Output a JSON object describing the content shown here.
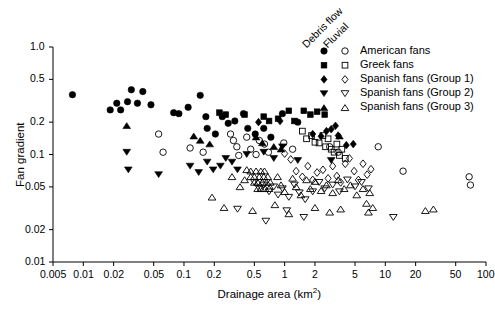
{
  "chart_data": {
    "type": "scatter",
    "title": "",
    "xlabel": "Drainage area (km2)",
    "xlabel_base": "Drainage area (km",
    "xlabel_sup": "2",
    "xlabel_tail": ")",
    "ylabel": "Fan gradient",
    "xscale": "log",
    "yscale": "log",
    "xlim": [
      0.005,
      100
    ],
    "ylim": [
      0.01,
      1.0
    ],
    "grid": false,
    "xticks": [
      0.005,
      0.01,
      0.02,
      0.05,
      0.1,
      0.2,
      0.5,
      1,
      2,
      5,
      10,
      20,
      50,
      100
    ],
    "xticklabels": [
      "0.005",
      "0.01",
      "0.02",
      "0.05",
      "0.1",
      "0.2",
      "0.5",
      "1",
      "2",
      "5",
      "10",
      "20",
      "50",
      "100"
    ],
    "yticks": [
      0.01,
      0.02,
      0.05,
      0.1,
      0.2,
      0.5,
      1.0
    ],
    "yticklabels": [
      "0.01",
      "0.02",
      "0.05",
      "0.1",
      "0.2",
      "0.5",
      "1.0"
    ],
    "legend": {
      "position": "top-right",
      "column_headers": [
        "Debris flow",
        "Fluvial"
      ],
      "header_rotation_deg": -45,
      "entries": [
        {
          "label": "American fans",
          "marker": "circle",
          "filled_marker": "filled-circle",
          "open_marker": "open-circle"
        },
        {
          "label": "Greek fans",
          "marker": "square",
          "filled_marker": "filled-square",
          "open_marker": "open-square"
        },
        {
          "label": "Spanish fans (Group 1)",
          "marker": "diamond",
          "filled_marker": "filled-diamond",
          "open_marker": "open-diamond"
        },
        {
          "label": "Spanish fans (Group 2)",
          "marker": "triangle-down",
          "filled_marker": "filled-tri-down",
          "open_marker": "open-tri-down"
        },
        {
          "label": "Spanish fans (Group 3)",
          "marker": "triangle-up",
          "filled_marker": "filled-tri-up",
          "open_marker": "open-tri-up"
        }
      ]
    },
    "series": [
      {
        "name": "American fans (debris flow)",
        "marker": "filled-circle",
        "points": [
          [
            0.0078,
            0.36
          ],
          [
            0.0185,
            0.26
          ],
          [
            0.0215,
            0.3
          ],
          [
            0.0235,
            0.26
          ],
          [
            0.0275,
            0.31
          ],
          [
            0.03,
            0.4
          ],
          [
            0.0345,
            0.3
          ],
          [
            0.039,
            0.385
          ],
          [
            0.047,
            0.29
          ],
          [
            0.079,
            0.245
          ],
          [
            0.089,
            0.24
          ],
          [
            0.11,
            0.275
          ],
          [
            0.145,
            0.355
          ],
          [
            0.165,
            0.225
          ],
          [
            0.17,
            0.175
          ],
          [
            0.205,
            0.155
          ],
          [
            0.24,
            0.225
          ],
          [
            0.275,
            0.195
          ],
          [
            0.32,
            0.205
          ],
          [
            0.39,
            0.24
          ],
          [
            0.43,
            0.175
          ],
          [
            0.51,
            0.155
          ],
          [
            0.62,
            0.175
          ],
          [
            0.73,
            0.145
          ],
          [
            0.95,
            0.24
          ],
          [
            1.35,
            0.2
          ]
        ]
      },
      {
        "name": "American fans (fluvial)",
        "marker": "open-circle",
        "points": [
          [
            0.056,
            0.155
          ],
          [
            0.062,
            0.105
          ],
          [
            0.115,
            0.115
          ],
          [
            0.155,
            0.105
          ],
          [
            0.29,
            0.155
          ],
          [
            0.31,
            0.135
          ],
          [
            0.335,
            0.118
          ],
          [
            0.35,
            0.098
          ],
          [
            0.42,
            0.145
          ],
          [
            0.46,
            0.112
          ],
          [
            0.52,
            0.1
          ],
          [
            0.56,
            0.135
          ],
          [
            0.63,
            0.125
          ],
          [
            0.69,
            0.105
          ],
          [
            0.98,
            0.128
          ],
          [
            1.2,
            0.112
          ],
          [
            2.8,
            0.118
          ],
          [
            3.4,
            0.105
          ],
          [
            8.5,
            0.118
          ],
          [
            15.0,
            0.07
          ],
          [
            68.0,
            0.062
          ],
          [
            70.0,
            0.052
          ]
        ]
      },
      {
        "name": "Greek fans (debris flow)",
        "marker": "filled-square",
        "points": [
          [
            0.225,
            0.245
          ],
          [
            0.26,
            0.235
          ],
          [
            0.4,
            0.235
          ],
          [
            0.62,
            0.225
          ],
          [
            0.7,
            0.205
          ],
          [
            0.86,
            0.215
          ],
          [
            1.1,
            0.255
          ],
          [
            1.25,
            0.205
          ],
          [
            1.55,
            0.255
          ],
          [
            1.8,
            0.235
          ],
          [
            2.1,
            0.25
          ],
          [
            2.5,
            0.235
          ]
        ]
      },
      {
        "name": "Greek fans (fluvial)",
        "marker": "open-square",
        "points": [
          [
            1.5,
            0.165
          ],
          [
            1.65,
            0.14
          ],
          [
            1.85,
            0.15
          ],
          [
            2.0,
            0.13
          ],
          [
            2.2,
            0.128
          ],
          [
            2.4,
            0.15
          ],
          [
            2.55,
            0.118
          ],
          [
            2.7,
            0.14
          ],
          [
            2.9,
            0.112
          ],
          [
            3.1,
            0.105
          ],
          [
            3.3,
            0.125
          ],
          [
            3.5,
            0.098
          ],
          [
            3.7,
            0.112
          ],
          [
            4.0,
            0.092
          ]
        ]
      },
      {
        "name": "Spanish fans Group 1 (debris flow)",
        "marker": "filled-diamond",
        "points": [
          [
            0.9,
            0.205
          ],
          [
            1.9,
            0.155
          ],
          [
            2.3,
            0.148
          ],
          [
            2.6,
            0.165
          ],
          [
            2.9,
            0.172
          ],
          [
            3.2,
            0.185
          ],
          [
            3.4,
            0.15
          ],
          [
            4.1,
            0.122
          ],
          [
            4.8,
            0.125
          ],
          [
            0.55,
            0.2
          ]
        ]
      },
      {
        "name": "Spanish fans Group 1 (fluvial)",
        "marker": "open-diamond",
        "points": [
          [
            1.15,
            0.09
          ],
          [
            1.3,
            0.07
          ],
          [
            1.5,
            0.062
          ],
          [
            1.7,
            0.078
          ],
          [
            1.9,
            0.058
          ],
          [
            2.1,
            0.068
          ],
          [
            2.4,
            0.072
          ],
          [
            2.7,
            0.06
          ],
          [
            3.0,
            0.078
          ],
          [
            3.3,
            0.063
          ],
          [
            3.6,
            0.055
          ],
          [
            4.0,
            0.082
          ],
          [
            4.4,
            0.092
          ],
          [
            4.9,
            0.07
          ],
          [
            5.4,
            0.058
          ],
          [
            6.0,
            0.082
          ],
          [
            6.6,
            0.065
          ],
          [
            7.2,
            0.073
          ],
          [
            1.0,
            0.102
          ]
        ]
      },
      {
        "name": "Spanish fans Group 2 (debris flow)",
        "marker": "filled-tri-down",
        "points": [
          [
            0.027,
            0.105
          ],
          [
            0.028,
            0.072
          ],
          [
            0.115,
            0.078
          ],
          [
            0.14,
            0.068
          ],
          [
            0.17,
            0.085
          ],
          [
            0.195,
            0.072
          ],
          [
            0.23,
            0.078
          ],
          [
            0.26,
            0.092
          ],
          [
            0.3,
            0.085
          ],
          [
            0.34,
            0.072
          ],
          [
            0.42,
            0.1
          ],
          [
            0.62,
            0.105
          ],
          [
            0.78,
            0.092
          ],
          [
            0.95,
            0.118
          ],
          [
            1.35,
            0.088
          ],
          [
            2.9,
            0.088
          ],
          [
            0.056,
            0.065
          ]
        ]
      },
      {
        "name": "Spanish fans Group 2 (fluvial)",
        "marker": "open-tri-down",
        "points": [
          [
            0.5,
            0.055
          ],
          [
            0.56,
            0.048
          ],
          [
            0.62,
            0.052
          ],
          [
            0.7,
            0.045
          ],
          [
            0.78,
            0.05
          ],
          [
            0.86,
            0.042
          ],
          [
            0.95,
            0.048
          ],
          [
            1.1,
            0.04
          ],
          [
            1.25,
            0.052
          ],
          [
            1.4,
            0.044
          ],
          [
            1.6,
            0.038
          ],
          [
            1.9,
            0.045
          ],
          [
            2.2,
            0.055
          ],
          [
            2.5,
            0.048
          ],
          [
            3.0,
            0.052
          ],
          [
            3.5,
            0.045
          ],
          [
            4.2,
            0.058
          ],
          [
            5.0,
            0.05
          ],
          [
            5.8,
            0.055
          ],
          [
            6.8,
            0.048
          ],
          [
            0.34,
            0.031
          ],
          [
            0.65,
            0.024
          ],
          [
            1.05,
            0.03
          ],
          [
            1.55,
            0.026
          ],
          [
            12.0,
            0.026
          ]
        ]
      },
      {
        "name": "Spanish fans Group 3 (debris flow)",
        "marker": "filled-tri-up",
        "points": [
          [
            0.027,
            0.185
          ],
          [
            0.125,
            0.148
          ],
          [
            0.145,
            0.135
          ],
          [
            0.18,
            0.125
          ],
          [
            0.52,
            0.145
          ],
          [
            0.6,
            0.128
          ],
          [
            0.78,
            0.118
          ],
          [
            3.5,
            0.148
          ],
          [
            0.92,
            0.112
          ]
        ]
      },
      {
        "name": "Spanish fans Group 3 (fluvial)",
        "marker": "open-tri-up",
        "points": [
          [
            0.42,
            0.072
          ],
          [
            0.46,
            0.062
          ],
          [
            0.5,
            0.055
          ],
          [
            0.54,
            0.048
          ],
          [
            0.46,
            0.07
          ],
          [
            0.5,
            0.062
          ],
          [
            0.54,
            0.055
          ],
          [
            0.58,
            0.048
          ],
          [
            0.52,
            0.07
          ],
          [
            0.56,
            0.062
          ],
          [
            0.6,
            0.055
          ],
          [
            0.64,
            0.048
          ],
          [
            0.58,
            0.07
          ],
          [
            0.62,
            0.062
          ],
          [
            0.66,
            0.055
          ],
          [
            0.63,
            0.07
          ],
          [
            0.68,
            0.062
          ],
          [
            0.72,
            0.055
          ],
          [
            0.7,
            0.048
          ],
          [
            0.4,
            0.058
          ],
          [
            0.36,
            0.05
          ],
          [
            0.3,
            0.062
          ],
          [
            0.85,
            0.062
          ],
          [
            0.92,
            0.052
          ],
          [
            1.0,
            0.045
          ],
          [
            1.2,
            0.06
          ],
          [
            1.3,
            0.05
          ],
          [
            1.45,
            0.042
          ],
          [
            1.65,
            0.058
          ],
          [
            1.8,
            0.048
          ],
          [
            2.0,
            0.056
          ],
          [
            2.3,
            0.046
          ],
          [
            2.6,
            0.052
          ],
          [
            3.0,
            0.044
          ],
          [
            3.4,
            0.058
          ],
          [
            3.9,
            0.048
          ],
          [
            4.5,
            0.052
          ],
          [
            5.2,
            0.042
          ],
          [
            6.0,
            0.048
          ],
          [
            7.0,
            0.044
          ],
          [
            0.25,
            0.032
          ],
          [
            0.48,
            0.03
          ],
          [
            0.8,
            0.034
          ],
          [
            1.1,
            0.028
          ],
          [
            2.0,
            0.032
          ],
          [
            2.8,
            0.029
          ],
          [
            3.6,
            0.031
          ],
          [
            6.5,
            0.035
          ],
          [
            6.8,
            0.029
          ],
          [
            7.5,
            0.032
          ],
          [
            25.0,
            0.03
          ],
          [
            30.0,
            0.031
          ],
          [
            0.19,
            0.04
          ]
        ]
      }
    ]
  }
}
